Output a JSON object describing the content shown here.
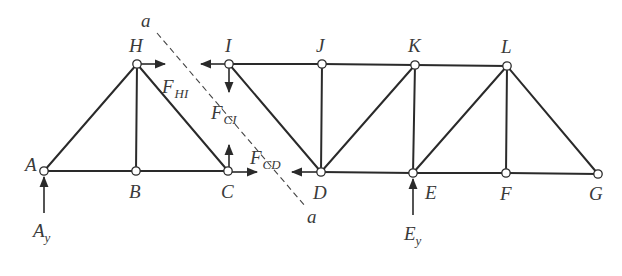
{
  "diagram": {
    "joints": {
      "A": {
        "label": "A",
        "x": 44,
        "y": 171
      },
      "B": {
        "label": "B",
        "x": 136,
        "y": 171
      },
      "C": {
        "label": "C",
        "x": 228,
        "y": 171
      },
      "D": {
        "label": "D",
        "x": 321,
        "y": 172
      },
      "E": {
        "label": "E",
        "x": 413,
        "y": 173
      },
      "F": {
        "label": "F",
        "x": 506,
        "y": 173
      },
      "G": {
        "label": "G",
        "x": 598,
        "y": 174
      },
      "H": {
        "label": "H",
        "x": 137,
        "y": 64
      },
      "I": {
        "label": "I",
        "x": 229,
        "y": 64
      },
      "J": {
        "label": "J",
        "x": 322,
        "y": 64
      },
      "K": {
        "label": "K",
        "x": 415,
        "y": 65
      },
      "L": {
        "label": "L",
        "x": 507,
        "y": 66
      }
    },
    "members": [
      [
        "A",
        "B"
      ],
      [
        "B",
        "C"
      ],
      [
        "C",
        "D"
      ],
      [
        "D",
        "E"
      ],
      [
        "E",
        "F"
      ],
      [
        "F",
        "G"
      ],
      [
        "H",
        "I"
      ],
      [
        "I",
        "J"
      ],
      [
        "J",
        "K"
      ],
      [
        "K",
        "L"
      ],
      [
        "A",
        "H"
      ],
      [
        "H",
        "B"
      ],
      [
        "H",
        "C"
      ],
      [
        "I",
        "D"
      ],
      [
        "J",
        "D"
      ],
      [
        "D",
        "K"
      ],
      [
        "K",
        "E"
      ],
      [
        "E",
        "L"
      ],
      [
        "L",
        "F"
      ],
      [
        "L",
        "G"
      ]
    ],
    "section": {
      "label_top": "a",
      "label_bottom": "a"
    },
    "forces": {
      "F_HI": {
        "main": "F",
        "sub": "HI"
      },
      "F_CI": {
        "main": "F",
        "sub": "CI"
      },
      "F_CD": {
        "main": "F",
        "sub": "CD"
      }
    },
    "reactions": {
      "A_y": {
        "main": "A",
        "sub": "y"
      },
      "E_y": {
        "main": "E",
        "sub": "y"
      }
    }
  }
}
